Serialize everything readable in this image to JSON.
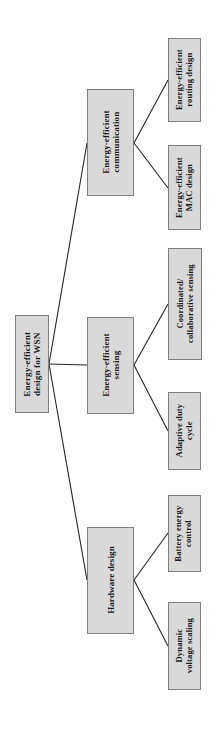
{
  "diagram": {
    "type": "hierarchy-tree",
    "orientation": "rotated-90-ccw",
    "colors": {
      "node_fill": "#d9d9d9",
      "node_border": "#7f7f7f",
      "edge": "#262626",
      "text": "#1a1a1a",
      "background": "#ffffff"
    },
    "nodes": [
      {
        "id": "root",
        "level": 0,
        "label": "Energy-efficient\ndesign for WSN",
        "box": {
          "x": 15,
          "y": 315,
          "w": 34,
          "h": 98
        }
      },
      {
        "id": "communication",
        "level": 1,
        "label": "Energy-efficient\ncommunication",
        "box": {
          "x": 87,
          "y": 89,
          "w": 47,
          "h": 107
        }
      },
      {
        "id": "sensing",
        "level": 1,
        "label": "Energy-efficient\nsensing",
        "box": {
          "x": 87,
          "y": 317,
          "w": 47,
          "h": 97
        }
      },
      {
        "id": "hardware",
        "level": 1,
        "label": "Hardware design",
        "box": {
          "x": 87,
          "y": 527,
          "w": 47,
          "h": 107
        }
      },
      {
        "id": "routing",
        "level": 2,
        "label": "Energy-efficient\nrouting design",
        "box": {
          "x": 168,
          "y": 38,
          "w": 33,
          "h": 84
        }
      },
      {
        "id": "mac",
        "level": 2,
        "label": "Energy-efficient\nMAC design",
        "box": {
          "x": 168,
          "y": 145,
          "w": 33,
          "h": 85
        }
      },
      {
        "id": "coordinated",
        "level": 2,
        "label": "Coordinated/\ncollaborative sensing",
        "box": {
          "x": 168,
          "y": 248,
          "w": 34,
          "h": 112
        }
      },
      {
        "id": "duty",
        "level": 2,
        "label": "Adaptive duty\ncycle",
        "box": {
          "x": 168,
          "y": 392,
          "w": 33,
          "h": 78
        }
      },
      {
        "id": "battery",
        "level": 2,
        "label": "Battery energy\ncontrol",
        "box": {
          "x": 168,
          "y": 495,
          "w": 33,
          "h": 77
        }
      },
      {
        "id": "dvs",
        "level": 2,
        "label": "Dynamic\nvoltage scaling",
        "box": {
          "x": 168,
          "y": 602,
          "w": 33,
          "h": 88
        }
      }
    ],
    "edges": [
      {
        "from": "root",
        "to": "communication",
        "x1": 49,
        "y1": 364,
        "x2": 87,
        "y2": 143
      },
      {
        "from": "root",
        "to": "sensing",
        "x1": 49,
        "y1": 364,
        "x2": 87,
        "y2": 365
      },
      {
        "from": "root",
        "to": "hardware",
        "x1": 49,
        "y1": 364,
        "x2": 87,
        "y2": 580
      },
      {
        "from": "communication",
        "to": "routing",
        "x1": 134,
        "y1": 143,
        "x2": 168,
        "y2": 80
      },
      {
        "from": "communication",
        "to": "mac",
        "x1": 134,
        "y1": 143,
        "x2": 168,
        "y2": 188
      },
      {
        "from": "sensing",
        "to": "coordinated",
        "x1": 134,
        "y1": 365,
        "x2": 168,
        "y2": 304
      },
      {
        "from": "sensing",
        "to": "duty",
        "x1": 134,
        "y1": 365,
        "x2": 168,
        "y2": 431
      },
      {
        "from": "hardware",
        "to": "battery",
        "x1": 134,
        "y1": 580,
        "x2": 168,
        "y2": 533
      },
      {
        "from": "hardware",
        "to": "dvs",
        "x1": 134,
        "y1": 580,
        "x2": 168,
        "y2": 646
      }
    ]
  }
}
